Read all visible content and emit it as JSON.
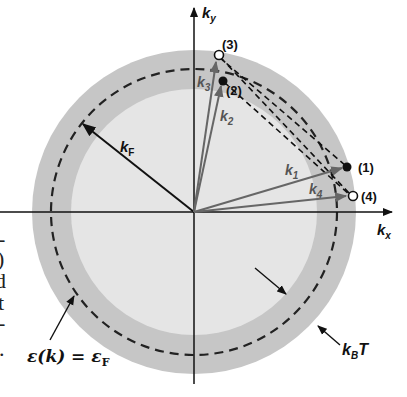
{
  "diagram": {
    "axes": {
      "x_label": "k",
      "x_sub": "x",
      "y_label": "k",
      "y_sub": "y"
    },
    "radius_label": {
      "main": "k",
      "sub": "F"
    },
    "vectors": [
      {
        "id": "k1",
        "main": "k",
        "sub": "1"
      },
      {
        "id": "k2",
        "main": "k",
        "sub": "2"
      },
      {
        "id": "k3",
        "main": "k",
        "sub": "3"
      },
      {
        "id": "k4",
        "main": "k",
        "sub": "4"
      }
    ],
    "points": [
      {
        "id": "1",
        "label": "(1)",
        "filled": true
      },
      {
        "id": "2",
        "label": "(2)",
        "filled": true
      },
      {
        "id": "3",
        "label": "(3)",
        "filled": false
      },
      {
        "id": "4",
        "label": "(4)",
        "filled": false
      }
    ],
    "annotations": {
      "fermi_surface": "ε(k) = ε",
      "fermi_surface_sub": "F",
      "thermal_width": "k",
      "thermal_width_sub": "B",
      "thermal_width_tail": "T"
    },
    "colors": {
      "outer_ring": "#c6c6c6",
      "inner_disk": "#e5e5e5",
      "axis": "#111111",
      "vector_gray": "#666666"
    },
    "edge_text_fragments": [
      "-",
      ")",
      "d",
      "t",
      "-",
      "."
    ]
  }
}
